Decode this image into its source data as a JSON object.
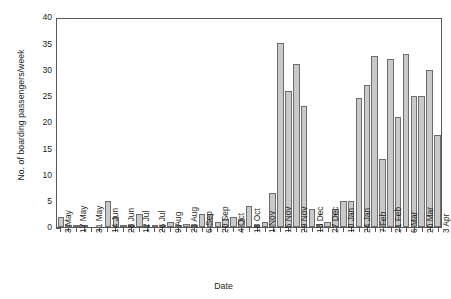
{
  "chart_data": {
    "type": "bar",
    "title": "",
    "xlabel": "Date",
    "ylabel": "No. of boarding passengers/week",
    "ylim": [
      0,
      40
    ],
    "yticks": [
      0,
      5,
      10,
      15,
      20,
      25,
      30,
      35,
      40
    ],
    "grid": false,
    "legend": null,
    "bar_color": "#c9c9c9",
    "bar_edge_color": "#6d6d6d",
    "axis_color": "#58585a",
    "categories": [
      "3 May",
      "10 May",
      "17 May",
      "24 May",
      "31 May",
      "7 Jun",
      "14 Jun",
      "21 Jun",
      "28 Jun",
      "5 Jul",
      "12 Jul",
      "19 Jul",
      "26 Jul",
      "2 Aug",
      "9 Aug",
      "16 Aug",
      "23 Aug",
      "30 Aug",
      "6 Sep",
      "13 Sep",
      "20 Sep",
      "27 Sep",
      "4 Oct",
      "11 Oct",
      "18 Oct",
      "25 Oct",
      "1 Nov",
      "8 Nov",
      "15 Nov",
      "22 Nov",
      "29 Nov",
      "6 Dec",
      "13 Dec",
      "20 Dec",
      "27 Dec",
      "3 Jan",
      "10 Jan",
      "17 Jan",
      "24 Jan",
      "31 Jan",
      "7 Feb",
      "14 Feb",
      "21 Feb",
      "28 Feb",
      "6 Mar",
      "13 Mar",
      "20 Mar",
      "27 Mar",
      "3 Apr"
    ],
    "tick_labels": [
      "3 May",
      "",
      "17 May",
      "",
      "31 May",
      "",
      "14 Jun",
      "",
      "28 Jun",
      "",
      "12 Jul",
      "",
      "26 Jul",
      "",
      "9 Aug",
      "",
      "23 Aug",
      "",
      "6 Sep",
      "",
      "20 Sep",
      "",
      "4 Oct",
      "",
      "18 Oct",
      "",
      "1 Nov",
      "",
      "15 Nov",
      "",
      "29 Nov",
      "",
      "13 Dec",
      "",
      "27 Dec",
      "",
      "10 Jan",
      "",
      "24 Jan",
      "",
      "7 Feb",
      "",
      "21 Feb",
      "",
      "6 Mar",
      "",
      "20 Mar",
      "",
      "3 Apr"
    ],
    "values": [
      2,
      0.3,
      0.3,
      0.3,
      0,
      0,
      5,
      2,
      0.3,
      0.3,
      2.5,
      0.3,
      0.3,
      0.3,
      1,
      0.3,
      0.5,
      0.3,
      2.5,
      2.5,
      1,
      1.5,
      2,
      1.5,
      4,
      0.3,
      1,
      6.5,
      35,
      26,
      31,
      23,
      3.5,
      0.5,
      1,
      3.5,
      5,
      5,
      24.5,
      27,
      32.5,
      13,
      32,
      21,
      33,
      25,
      25,
      30,
      17.5
    ]
  }
}
